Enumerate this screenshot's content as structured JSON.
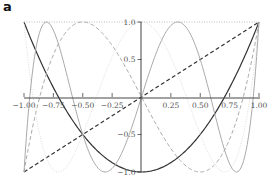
{
  "panel_label": "a",
  "chart_data": {
    "type": "line",
    "title": "",
    "xlabel": "",
    "ylabel": "",
    "xlim": [
      -1.0,
      1.0
    ],
    "ylim": [
      -1.0,
      1.0
    ],
    "grid": false,
    "legend": "none",
    "x_ticks": [
      "-1.00",
      "-0.75",
      "-0.50",
      "-0.25",
      "0.25",
      "0.50",
      "0.75",
      "1.00"
    ],
    "x_tick_values": [
      -1.0,
      -0.75,
      -0.5,
      -0.25,
      0.25,
      0.5,
      0.75,
      1.0
    ],
    "y_ticks": [
      "1.0",
      "0.5",
      "-0.5",
      "-1.0"
    ],
    "y_tick_values": [
      1.0,
      0.5,
      -0.5,
      -1.0
    ],
    "series": [
      {
        "name": "T0",
        "formula": "1",
        "degree": 0,
        "color": "#bbbbbb",
        "style": "dotted",
        "width": 1.0
      },
      {
        "name": "T1",
        "formula": "x",
        "degree": 1,
        "color": "#333333",
        "style": "dashed",
        "width": 1.2
      },
      {
        "name": "T2",
        "formula": "2x^2-1",
        "degree": 2,
        "color": "#333333",
        "style": "solid",
        "width": 1.2
      },
      {
        "name": "T3",
        "formula": "4x^3-3x",
        "degree": 3,
        "color": "#aaaaaa",
        "style": "dashed",
        "width": 1.0
      },
      {
        "name": "T4",
        "formula": "8x^4-8x^2+1",
        "degree": 4,
        "color": "#dddddd",
        "style": "dotted",
        "width": 1.0
      },
      {
        "name": "T5",
        "formula": "16x^5-20x^3+5x",
        "degree": 5,
        "color": "#aaaaaa",
        "style": "solid",
        "width": 1.0
      }
    ]
  }
}
